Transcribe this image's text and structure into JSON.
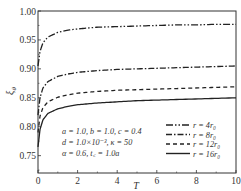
{
  "chart_data": {
    "type": "line",
    "title": "",
    "xlabel": "T",
    "ylabel": "ξθ",
    "xlim": [
      0,
      10
    ],
    "ylim": [
      0.72,
      1.0
    ],
    "xticks": [
      0,
      2,
      4,
      6,
      8,
      10
    ],
    "xtick_labels": [
      "0",
      "2",
      "4",
      "6",
      "8",
      "10"
    ],
    "yticks": [
      0.75,
      0.8,
      0.85,
      0.9,
      0.95,
      1.0
    ],
    "ytick_labels": [
      "0.75",
      "0.80",
      "0.85",
      "0.90",
      "0.95",
      "1.00"
    ],
    "grid": false,
    "legend_position": "lower right",
    "x": [
      0,
      0.1,
      0.25,
      0.5,
      1,
      1.5,
      2,
      3,
      4,
      5,
      6,
      7,
      8,
      9,
      10
    ],
    "series": [
      {
        "name": "r = 4r0",
        "style": "dash-dot-dot",
        "start": 0.905,
        "values": [
          0.905,
          0.93,
          0.945,
          0.955,
          0.963,
          0.967,
          0.969,
          0.972,
          0.973,
          0.974,
          0.975,
          0.976,
          0.976,
          0.977,
          0.977
        ]
      },
      {
        "name": "r = 8r0",
        "style": "dash-dot",
        "start": 0.82,
        "values": [
          0.82,
          0.85,
          0.867,
          0.878,
          0.887,
          0.891,
          0.894,
          0.897,
          0.899,
          0.9,
          0.901,
          0.902,
          0.903,
          0.904,
          0.905
        ]
      },
      {
        "name": "r = 12r0",
        "style": "dashed",
        "start": 0.79,
        "values": [
          0.79,
          0.818,
          0.833,
          0.843,
          0.851,
          0.855,
          0.858,
          0.861,
          0.863,
          0.864,
          0.865,
          0.866,
          0.867,
          0.868,
          0.869
        ]
      },
      {
        "name": "r = 16r0",
        "style": "solid",
        "start": 0.765,
        "values": [
          0.765,
          0.795,
          0.812,
          0.823,
          0.831,
          0.835,
          0.838,
          0.841,
          0.843,
          0.845,
          0.846,
          0.847,
          0.848,
          0.849,
          0.85
        ]
      }
    ],
    "annotations": [
      "a = 1.0,  b = 1.0,  c = 0.4",
      "d = 1.0×10⁻³,  κ = 50",
      "α = 0.6,  t꜀ = 1.0a"
    ]
  },
  "legend": {
    "items": [
      {
        "label": "r = 4r₀",
        "style": "dash-dot-dot"
      },
      {
        "label": "r = 8r₀",
        "style": "dash-dot"
      },
      {
        "label": "r = 12r₀",
        "style": "dashed"
      },
      {
        "label": "r = 16r₀",
        "style": "solid"
      }
    ]
  },
  "axes": {
    "xlabel": "T",
    "ylabel_main": "ξ",
    "ylabel_sub": "θ"
  },
  "annotation_lines": [
    "a = 1.0,  b = 1.0,  c = 0.4",
    "d = 1.0×10⁻³,  κ = 50",
    "α = 0.6,  t꜀ = 1.0a"
  ]
}
